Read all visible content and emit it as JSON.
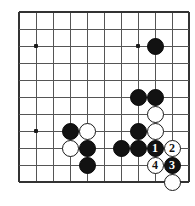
{
  "diagram": {
    "kind": "go-board-diagram",
    "board": {
      "cols": 11,
      "rows": 11,
      "cell_size": 17,
      "origin_x": 19,
      "origin_y": 12,
      "line_color": "#555555",
      "edge_color": "#333333",
      "background_color": "#ffffff",
      "line_width": 1,
      "edge_width": 1.6,
      "show_right_edge": true,
      "show_bottom_edge": true,
      "show_top_edge": true,
      "show_left_edge": true
    },
    "colors": {
      "black_stone": "#121212",
      "white_stone": "#ffffff",
      "white_stone_border": "#1a1a1a",
      "black_label": "#ffffff",
      "white_label": "#121212",
      "hoshi": "#1a1a1a"
    },
    "stone_radius": 8.5,
    "hoshi_size": 3.6,
    "hoshi_points": [
      {
        "col": 1,
        "row": 2,
        "name": "star-point-left"
      },
      {
        "col": 7,
        "row": 2,
        "name": "star-point-upper-right"
      },
      {
        "col": 1,
        "row": 7,
        "name": "star-point-lower-left"
      }
    ],
    "stones": [
      {
        "col": 8,
        "row": 2,
        "color": "black",
        "label": "",
        "name": "black-stone-upper-right"
      },
      {
        "col": 7,
        "row": 5,
        "color": "black",
        "label": "",
        "name": "black-stone-c7r5"
      },
      {
        "col": 8,
        "row": 5,
        "color": "black",
        "label": "",
        "name": "black-stone-c8r5"
      },
      {
        "col": 8,
        "row": 6,
        "color": "white",
        "label": "",
        "name": "white-stone-c8r6"
      },
      {
        "col": 7,
        "row": 7,
        "color": "black",
        "label": "",
        "name": "black-stone-c7r7"
      },
      {
        "col": 8,
        "row": 7,
        "color": "white",
        "label": "",
        "name": "white-stone-c8r7"
      },
      {
        "col": 3,
        "row": 7,
        "color": "black",
        "label": "",
        "name": "black-stone-c3r7"
      },
      {
        "col": 4,
        "row": 7,
        "color": "white",
        "label": "",
        "name": "white-stone-c4r7"
      },
      {
        "col": 3,
        "row": 8,
        "color": "white",
        "label": "",
        "name": "white-stone-c3r8"
      },
      {
        "col": 4,
        "row": 8,
        "color": "black",
        "label": "",
        "name": "black-stone-c4r8"
      },
      {
        "col": 6,
        "row": 8,
        "color": "black",
        "label": "",
        "name": "black-stone-c6r8"
      },
      {
        "col": 7,
        "row": 8,
        "color": "black",
        "label": "",
        "name": "black-stone-c7r8"
      },
      {
        "col": 8,
        "row": 8,
        "color": "black",
        "label": "1",
        "name": "black-stone-move-1"
      },
      {
        "col": 9,
        "row": 8,
        "color": "white",
        "label": "2",
        "name": "white-stone-move-2"
      },
      {
        "col": 4,
        "row": 9,
        "color": "black",
        "label": "",
        "name": "black-stone-c4r9"
      },
      {
        "col": 8,
        "row": 9,
        "color": "white",
        "label": "4",
        "name": "white-stone-move-4"
      },
      {
        "col": 9,
        "row": 9,
        "color": "black",
        "label": "3",
        "name": "black-stone-move-3"
      },
      {
        "col": 9,
        "row": 10,
        "color": "white",
        "label": "",
        "name": "white-stone-c9r10"
      }
    ],
    "move_sequence": [
      {
        "number": "1",
        "color": "black"
      },
      {
        "number": "2",
        "color": "white"
      },
      {
        "number": "3",
        "color": "black"
      },
      {
        "number": "4",
        "color": "white"
      }
    ]
  }
}
